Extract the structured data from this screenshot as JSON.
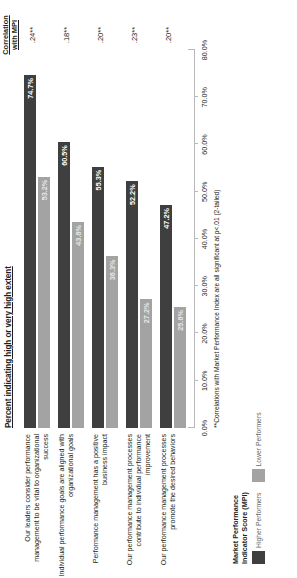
{
  "chart_data": {
    "type": "bar",
    "orientation": "horizontal",
    "title": "Percent indicating high or very high extent",
    "xlabel": "",
    "ylabel": "",
    "xlim": [
      0,
      80
    ],
    "grid": false,
    "legend_position": "bottom-left",
    "categories": [
      "Our leaders consider performance management to be vital to organizational success",
      "Individual performance goals are aligned with organizational goals",
      "Performance management has a positive business impact",
      "Our performance management processes contribute to individual performance improvement",
      "Our performance management processes promote the desired behaviors"
    ],
    "series": [
      {
        "name": "Higher Performers",
        "color": "#3f3f3f",
        "values": [
          74.7,
          60.5,
          55.3,
          52.2,
          47.2
        ],
        "labels": [
          "74.7%",
          "60.5%",
          "55.3%",
          "52.2%",
          "47.2%"
        ]
      },
      {
        "name": "Lower Performers",
        "color": "#a3a3a3",
        "values": [
          53.2,
          43.6,
          36.3,
          27.2,
          25.6
        ],
        "labels": [
          "53.2%",
          "43.6%",
          "36.3%",
          "27.2%",
          "25.6%"
        ]
      }
    ],
    "annotation_column": {
      "header_line1": "Correlation",
      "header_line2": "with MPI",
      "values": [
        ".24**",
        ".18**",
        ".20**",
        ".23**",
        ".20**"
      ]
    },
    "xticks": [
      0,
      10,
      20,
      30,
      40,
      50,
      60,
      70,
      80
    ],
    "xticklabels": [
      "0.0%",
      "10.0%",
      "20.0%",
      "30.0%",
      "40.0%",
      "50.0%",
      "60.0%",
      "70.0%",
      "80.0%"
    ],
    "footnote": "**Correlations with Market Performance Index are all significant at  p<.01 (2-tailed)"
  },
  "legend": {
    "title_line1": "Market Performance",
    "title_line2": "Indicator Score (MPI)",
    "items": [
      {
        "label": "Higher Performers",
        "color": "#3f3f3f"
      },
      {
        "label": "Lower Performers",
        "color": "#a3a3a3"
      }
    ]
  }
}
